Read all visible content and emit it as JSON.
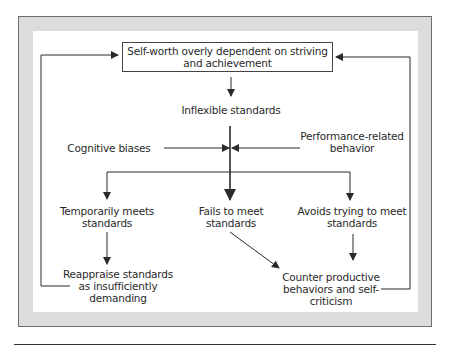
{
  "diagram": {
    "nodes": {
      "self_worth": {
        "line1": "Self-worth overly dependent on striving",
        "line2": "and achievement"
      },
      "inflexible": {
        "label": "Inflexible standards"
      },
      "cognitive": {
        "label": "Cognitive biases"
      },
      "performance": {
        "line1": "Performance-related",
        "line2": "behavior"
      },
      "temporarily": {
        "line1": "Temporarily meets",
        "line2": "standards"
      },
      "fails": {
        "line1": "Fails to meet",
        "line2": "standards"
      },
      "avoids": {
        "line1": "Avoids trying to meet",
        "line2": "standards"
      },
      "reappraise": {
        "line1": "Reappraise standards",
        "line2": "as insufficiently",
        "line3": "demanding"
      },
      "counter": {
        "line1": "Counter productive",
        "line2": "behaviors and self-",
        "line3": "criticism"
      }
    },
    "edges": [
      {
        "from": "self_worth",
        "to": "inflexible"
      },
      {
        "from": "inflexible",
        "to": "fails",
        "style": "thick"
      },
      {
        "from": "cognitive",
        "to": "inflexible-stem"
      },
      {
        "from": "performance",
        "to": "inflexible-stem"
      },
      {
        "from": "inflexible-stem",
        "to": "temporarily"
      },
      {
        "from": "inflexible-stem",
        "to": "avoids"
      },
      {
        "from": "temporarily",
        "to": "reappraise"
      },
      {
        "from": "fails",
        "to": "counter"
      },
      {
        "from": "avoids",
        "to": "counter"
      },
      {
        "from": "reappraise",
        "to": "self_worth",
        "style": "feedback-left"
      },
      {
        "from": "counter",
        "to": "self_worth",
        "style": "feedback-right"
      }
    ],
    "colors": {
      "frame": "#dcdcdc",
      "line": "#2a2a2a",
      "background": "#ffffff"
    }
  }
}
